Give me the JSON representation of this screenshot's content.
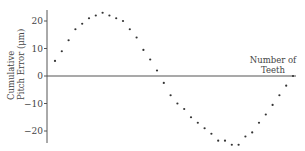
{
  "chart_data": {
    "type": "scatter",
    "title": "",
    "xlabel_line1": "Number of",
    "xlabel_line2": "Teeth",
    "ylabel_line1": "Cumulative",
    "ylabel_line2": "Pitch Error (μm)",
    "yticks": [
      20,
      10,
      0,
      -10,
      -20
    ],
    "ylim": [
      -25,
      25
    ],
    "grid": false,
    "legend": null,
    "x": [
      1,
      2,
      3,
      4,
      5,
      6,
      7,
      8,
      9,
      10,
      11,
      12,
      13,
      14,
      15,
      16,
      17,
      18,
      19,
      20,
      21,
      22,
      23,
      24,
      25,
      26,
      27,
      28,
      29,
      30,
      31,
      32,
      33,
      34,
      35,
      36
    ],
    "values": [
      5.5,
      9,
      13,
      17,
      19,
      21,
      22,
      23,
      22,
      21,
      20,
      17,
      14,
      9.5,
      6,
      2,
      -2.5,
      -7,
      -10,
      -12,
      -15,
      -17,
      -19,
      -21,
      -23.5,
      -23.5,
      -25,
      -25,
      -22,
      -20.5,
      -17,
      -14,
      -10.5,
      -7,
      -3.5,
      0
    ]
  }
}
